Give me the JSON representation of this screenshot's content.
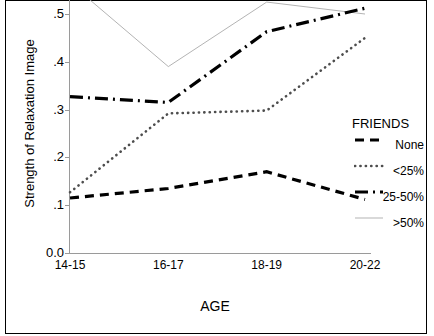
{
  "chart_data": {
    "type": "line",
    "title": "",
    "xlabel": "AGE",
    "ylabel": "Strength of Relaxation Image",
    "categories": [
      "14-15",
      "16-17",
      "18-19",
      "20-22"
    ],
    "ylim": [
      0.0,
      0.55
    ],
    "ytick_labels": [
      "0.0",
      ".1",
      ".2",
      ".3",
      ".4",
      ".5"
    ],
    "ytick_values": [
      0.0,
      0.1,
      0.2,
      0.3,
      0.4,
      0.5
    ],
    "grid": false,
    "legend_position": "right",
    "legend_title": "FRIENDS",
    "series": [
      {
        "name": "None",
        "style": "dashed",
        "color": "#000000",
        "values": [
          0.115,
          0.135,
          0.17,
          0.112
        ]
      },
      {
        "name": "<25%",
        "style": "dotted",
        "color": "#4d4d4d",
        "values": [
          0.127,
          0.292,
          0.298,
          0.45
        ]
      },
      {
        "name": "25-50%",
        "style": "dash-dot",
        "color": "#000000",
        "values": [
          0.327,
          0.315,
          0.463,
          0.512
        ]
      },
      {
        "name": ">50%",
        "style": "thin-solid",
        "color": "#aaaaaa",
        "values": [
          0.565,
          0.39,
          0.525,
          0.5
        ]
      }
    ]
  },
  "axis": {
    "x_title": "AGE",
    "y_title": "Strength of Relaxation Image"
  },
  "legend": {
    "title": "FRIENDS",
    "items": [
      {
        "label": "None",
        "swatch": "dashed-swatch"
      },
      {
        "label": "<25%",
        "swatch": "dotted-swatch"
      },
      {
        "label": "25-50%",
        "swatch": "dash-dot-swatch"
      },
      {
        "label": ">50%",
        "swatch": "thin-solid-swatch"
      }
    ]
  }
}
